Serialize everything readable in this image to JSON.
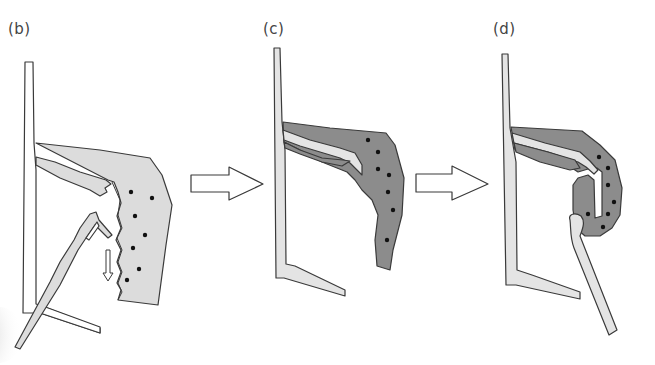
{
  "figure": {
    "panels": [
      {
        "id": "b",
        "label": "(b)",
        "tissue_state": "light",
        "instrument": "forceps",
        "dot_count": 7
      },
      {
        "id": "c",
        "label": "(c)",
        "tissue_state": "dark",
        "instrument": "none",
        "dot_count": 7
      },
      {
        "id": "d",
        "label": "(d)",
        "tissue_state": "dark-folded",
        "instrument": "probe",
        "dot_count": 8
      }
    ],
    "transition_arrows": [
      {
        "from": "b",
        "to": "c",
        "icon": "right-arrow-outline"
      },
      {
        "from": "c",
        "to": "d",
        "icon": "right-arrow-outline"
      }
    ],
    "colors": {
      "background": "#ffffff",
      "outline": "#3a3a3a",
      "bone_fill": "#e4e4e4",
      "tissue_light": "#dcdcdc",
      "tissue_dark": "#8c8c8c",
      "dot": "#111111"
    }
  }
}
